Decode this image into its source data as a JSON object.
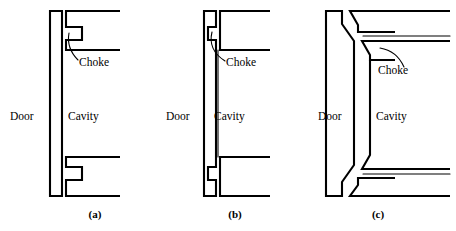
{
  "figure": {
    "background_color": "#ffffff",
    "line_color": "#000000",
    "type": "technical-cross-section-diagram",
    "panels": [
      {
        "id": "a",
        "caption": "(a)",
        "caption_x": 95,
        "caption_y": 218,
        "labels": {
          "door": "Door",
          "cavity": "Cavity",
          "choke": "Choke"
        },
        "label_positions": {
          "door_x": 10,
          "door_y": 117,
          "cavity_x": 68,
          "cavity_y": 117,
          "choke_x": 79,
          "choke_y": 63
        },
        "choke_style": "rectangular-notch",
        "door_style": "flat-slab"
      },
      {
        "id": "b",
        "caption": "(b)",
        "caption_x": 75,
        "caption_y": 218,
        "labels": {
          "door": "Door",
          "cavity": "Cavity",
          "choke": "Choke"
        },
        "label_positions": {
          "door_x": 6,
          "door_y": 117,
          "cavity_x": 54,
          "cavity_y": 117,
          "choke_x": 66,
          "choke_y": 63
        },
        "choke_style": "rectangular-notch",
        "door_style": "c-channel-bracket"
      },
      {
        "id": "c",
        "caption": "(c)",
        "caption_x": 78,
        "caption_y": 218,
        "labels": {
          "door": "Door",
          "cavity": "Cavity",
          "choke": "Choke"
        },
        "label_positions": {
          "door_x": 18,
          "door_y": 117,
          "cavity_x": 66,
          "cavity_y": 117,
          "choke_x": 72,
          "choke_y": 71
        },
        "choke_style": "tapered-angled-slot",
        "door_style": "stepped-tapered-slab"
      }
    ]
  }
}
